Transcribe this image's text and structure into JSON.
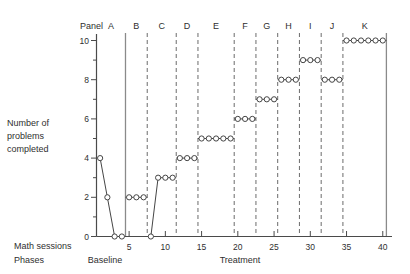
{
  "figure": {
    "panel_row_title": "Panel",
    "y_axis": {
      "label_lines": [
        "Number of",
        "problems",
        "completed"
      ],
      "major_ticks": [
        0,
        2,
        4,
        6,
        8,
        10
      ],
      "minor_ticks": [
        1,
        3,
        5,
        7,
        9
      ],
      "range": [
        0,
        10
      ]
    },
    "x_axis": {
      "label": "Math sessions",
      "major_ticks": [
        5,
        10,
        15,
        20,
        25,
        30,
        35,
        40
      ],
      "range": [
        1,
        40
      ]
    },
    "phases_row_title": "Phases",
    "phases": [
      {
        "name": "Baseline"
      },
      {
        "name": "Treatment"
      }
    ]
  },
  "chart_data": {
    "type": "line",
    "title": "",
    "xlabel": "Math sessions",
    "ylabel": "Number of problems completed",
    "xlim": [
      0.5,
      40.5
    ],
    "ylim": [
      0,
      10
    ],
    "grid": false,
    "legend": false,
    "marker": "open-circle",
    "panels": [
      {
        "label": "A",
        "phase": "Baseline",
        "span": [
          0.5,
          4.5
        ],
        "extend_left": false,
        "extend_right": true,
        "sessions": [
          1,
          2,
          3,
          4
        ],
        "values": [
          4,
          2,
          0,
          0
        ]
      },
      {
        "label": "B",
        "phase": "Treatment",
        "span": [
          4.5,
          7.5
        ],
        "extend_left": true,
        "extend_right": true,
        "sessions": [
          5,
          6,
          7
        ],
        "values": [
          2,
          2,
          2
        ]
      },
      {
        "label": "C",
        "phase": "Treatment",
        "span": [
          7.5,
          11.5
        ],
        "extend_left": true,
        "extend_right": true,
        "sessions": [
          8,
          9,
          10,
          11
        ],
        "values": [
          0,
          3,
          3,
          3
        ]
      },
      {
        "label": "D",
        "phase": "Treatment",
        "span": [
          11.5,
          14.5
        ],
        "extend_left": true,
        "extend_right": true,
        "sessions": [
          12,
          13,
          14
        ],
        "values": [
          4,
          4,
          4
        ]
      },
      {
        "label": "E",
        "phase": "Treatment",
        "span": [
          14.5,
          19.5
        ],
        "extend_left": true,
        "extend_right": true,
        "sessions": [
          15,
          16,
          17,
          18,
          19
        ],
        "values": [
          5,
          5,
          5,
          5,
          5
        ]
      },
      {
        "label": "F",
        "phase": "Treatment",
        "span": [
          19.5,
          22.5
        ],
        "extend_left": true,
        "extend_right": true,
        "sessions": [
          20,
          21,
          22
        ],
        "values": [
          6,
          6,
          6
        ]
      },
      {
        "label": "G",
        "phase": "Treatment",
        "span": [
          22.5,
          25.5
        ],
        "extend_left": true,
        "extend_right": true,
        "sessions": [
          23,
          24,
          25
        ],
        "values": [
          7,
          7,
          7
        ]
      },
      {
        "label": "H",
        "phase": "Treatment",
        "span": [
          25.5,
          28.5
        ],
        "extend_left": true,
        "extend_right": true,
        "sessions": [
          26,
          27,
          28
        ],
        "values": [
          8,
          8,
          8
        ]
      },
      {
        "label": "I",
        "phase": "Treatment",
        "span": [
          28.5,
          31.5
        ],
        "extend_left": true,
        "extend_right": true,
        "sessions": [
          29,
          30,
          31
        ],
        "values": [
          9,
          9,
          9
        ]
      },
      {
        "label": "J",
        "phase": "Treatment",
        "span": [
          31.5,
          34.5
        ],
        "extend_left": true,
        "extend_right": true,
        "sessions": [
          32,
          33,
          34
        ],
        "values": [
          8,
          8,
          8
        ]
      },
      {
        "label": "K",
        "phase": "Treatment",
        "span": [
          34.5,
          40.5
        ],
        "extend_left": true,
        "extend_right": true,
        "sessions": [
          35,
          36,
          37,
          38,
          39,
          40
        ],
        "values": [
          10,
          10,
          10,
          10,
          10,
          10
        ]
      }
    ],
    "phase_boundaries": {
      "solid": [
        4.5,
        40.5
      ],
      "dashed": [
        7.5,
        11.5,
        14.5,
        19.5,
        22.5,
        25.5,
        28.5,
        31.5,
        34.5
      ]
    }
  },
  "colors": {
    "line": "#454545",
    "axis": "#4a4a4a",
    "dashed_line": "#6b6b6b",
    "solid_phase_line": "#8a8a8a",
    "text": "#2f2f2f",
    "point_fill": "#ffffff",
    "background": "#ffffff"
  }
}
